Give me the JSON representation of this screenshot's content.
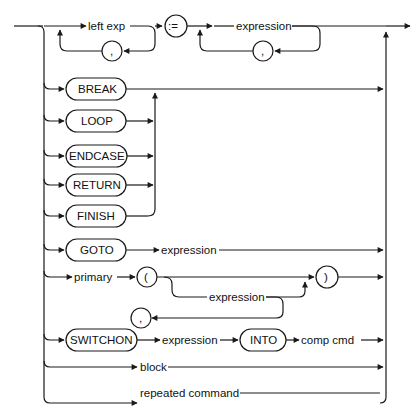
{
  "diagram": {
    "type": "syntax-railroad-diagram",
    "title": "",
    "colors": {
      "line": "#1a1a1a",
      "text": "#111111",
      "background": "#ffffff"
    },
    "rows": [
      {
        "id": "assignment",
        "elements": [
          {
            "kind": "nonterminal",
            "text": "left exp",
            "repeat_separator": ","
          },
          {
            "kind": "terminal",
            "text": ":="
          },
          {
            "kind": "nonterminal",
            "text": "expression",
            "repeat_separator": ","
          }
        ]
      },
      {
        "id": "break",
        "elements": [
          {
            "kind": "keyword",
            "text": "BREAK"
          }
        ]
      },
      {
        "id": "loop",
        "elements": [
          {
            "kind": "keyword",
            "text": "LOOP"
          }
        ]
      },
      {
        "id": "endcase",
        "elements": [
          {
            "kind": "keyword",
            "text": "ENDCASE"
          }
        ]
      },
      {
        "id": "return",
        "elements": [
          {
            "kind": "keyword",
            "text": "RETURN"
          }
        ]
      },
      {
        "id": "finish",
        "elements": [
          {
            "kind": "keyword",
            "text": "FINISH"
          }
        ]
      },
      {
        "id": "goto",
        "elements": [
          {
            "kind": "keyword",
            "text": "GOTO"
          },
          {
            "kind": "nonterminal",
            "text": "expression"
          }
        ]
      },
      {
        "id": "call",
        "elements": [
          {
            "kind": "nonterminal",
            "text": "primary"
          },
          {
            "kind": "terminal",
            "text": "("
          },
          {
            "kind": "nonterminal",
            "text": "expression",
            "optional": true,
            "repeat_separator": ","
          },
          {
            "kind": "terminal",
            "text": ")"
          }
        ]
      },
      {
        "id": "switchon",
        "elements": [
          {
            "kind": "keyword",
            "text": "SWITCHON"
          },
          {
            "kind": "nonterminal",
            "text": "expression"
          },
          {
            "kind": "keyword",
            "text": "INTO"
          },
          {
            "kind": "nonterminal",
            "text": "comp  cmd"
          }
        ]
      },
      {
        "id": "block",
        "elements": [
          {
            "kind": "nonterminal",
            "text": "block"
          }
        ]
      },
      {
        "id": "repeated",
        "elements": [
          {
            "kind": "nonterminal",
            "text": "repeated command"
          }
        ]
      }
    ],
    "labels": {
      "left_exp": "left exp",
      "comma": ",",
      "assign": ":=",
      "expression": "expression",
      "break": "BREAK",
      "loop": "LOOP",
      "endcase": "ENDCASE",
      "return": "RETURN",
      "finish": "FINISH",
      "goto": "GOTO",
      "primary": "primary",
      "lparen": "(",
      "rparen": ")",
      "switchon": "SWITCHON",
      "into": "INTO",
      "comp_cmd": "comp  cmd",
      "block": "block",
      "repeated_command": "repeated command"
    }
  }
}
